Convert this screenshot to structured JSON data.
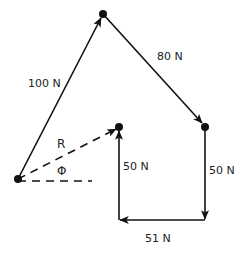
{
  "diagram": {
    "colors": {
      "stroke": "#111111",
      "text": "#222222",
      "background": "#ffffff"
    },
    "points": {
      "origin": [
        18,
        179
      ],
      "top": [
        103,
        14
      ],
      "right": [
        205,
        127
      ],
      "bottom_right": [
        205,
        220
      ],
      "bottom_left": [
        119,
        220
      ],
      "end": [
        119,
        127
      ]
    },
    "vectors": [
      {
        "id": "v1",
        "label": "100 N",
        "from": "origin",
        "to": "top"
      },
      {
        "id": "v2",
        "label": "80 N",
        "from": "top",
        "to": "right"
      },
      {
        "id": "v3",
        "label": "50 N",
        "from": "right",
        "to": "bottom_right"
      },
      {
        "id": "v4",
        "label": "51 N",
        "from": "bottom_right",
        "to": "bottom_left"
      },
      {
        "id": "v5",
        "label": "50 N",
        "from": "bottom_left",
        "to": "end"
      }
    ],
    "resultant": {
      "label": "R",
      "style": "dashed",
      "from": "origin",
      "to": "end"
    },
    "reference_line": {
      "style": "dashed",
      "from": [
        18,
        181
      ],
      "to": [
        92,
        181
      ]
    },
    "angle": {
      "label": "Φ"
    },
    "labels": {
      "v1": "100 N",
      "v2": "80 N",
      "v3": "50 N",
      "v4": "51 N",
      "v5": "50 N",
      "resultant": "R",
      "angle": "Φ"
    }
  }
}
